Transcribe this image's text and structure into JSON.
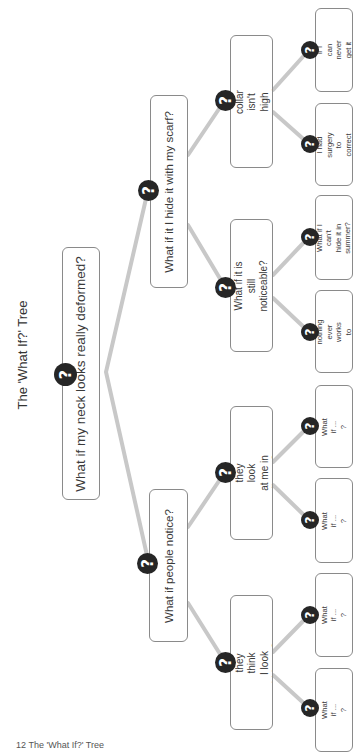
{
  "title": "The 'What If?' Tree",
  "caption": "12  The 'What If?' Tree",
  "colors": {
    "line": "#c8c8c8",
    "box_border": "#8a8a8a",
    "circle": "#262626",
    "circle_glyph": "#ffffff"
  },
  "icon": {
    "question": "?"
  },
  "root": {
    "label": "What if my neck looks really deformed?"
  },
  "branches": [
    {
      "label": "What if it I hide it with my scarf?",
      "children": [
        {
          "label": "What if my shirt collar isn't\nhigh enough to hide it?",
          "leaves": [
            "What if I can never\nget it fixed?",
            "What if I had\nsurgery to\ncorrect it?"
          ]
        },
        {
          "label": "What if it is still noticeable?",
          "leaves": [
            "What if I can't\nhide it in summer?",
            "What if nothing\never works to\nhide it?"
          ]
        }
      ]
    },
    {
      "label": "What if people notice?",
      "children": [
        {
          "label": "What if they look\nat me in disgust?",
          "leaves": [
            "What if ... ?",
            "What if ... ?"
          ]
        },
        {
          "label": "What if they think\nI look hideous?",
          "leaves": [
            "What if ... ?",
            "What if ... ?"
          ]
        }
      ]
    }
  ]
}
